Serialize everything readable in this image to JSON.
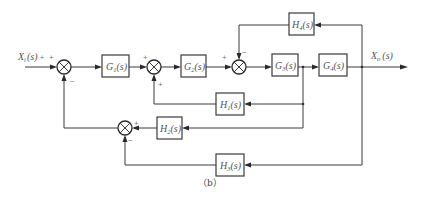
{
  "diagram": {
    "type": "control-system-block-diagram",
    "caption": "（b）",
    "input": {
      "label": "X",
      "subscript": "i",
      "suffix": "(s)",
      "sign": "+"
    },
    "output": {
      "label": "X",
      "subscript": "o",
      "suffix": "(s)"
    },
    "blocks": {
      "G1": {
        "name": "G",
        "sub": "1",
        "arg": "(s)"
      },
      "G2": {
        "name": "G",
        "sub": "2",
        "arg": "(s)"
      },
      "G3": {
        "name": "G",
        "sub": "3",
        "arg": "(s)"
      },
      "G4": {
        "name": "G",
        "sub": "4",
        "arg": "(s)"
      },
      "H1": {
        "name": "H",
        "sub": "1",
        "arg": "(s)"
      },
      "H2": {
        "name": "H",
        "sub": "2",
        "arg": "(s)"
      },
      "H3": {
        "name": "H",
        "sub": "3",
        "arg": "(s)"
      },
      "H4": {
        "name": "H",
        "sub": "4",
        "arg": "(s)"
      }
    },
    "summing_junctions": [
      {
        "id": "S1",
        "signs": {
          "left": "+",
          "bottom": "−"
        }
      },
      {
        "id": "S2",
        "signs": {
          "left": "+",
          "bottom": "+"
        }
      },
      {
        "id": "S3",
        "signs": {
          "left": "+",
          "top": "−"
        }
      },
      {
        "id": "S4",
        "signs": {
          "right": "+",
          "bottom": "−"
        }
      }
    ],
    "connections": [
      "Xi(s) -> S1",
      "S1 -> G1 -> S2 -> G2 -> S3 -> G3 -> G4 -> Xo(s)",
      "Xo(s) -> H4 -> S3 (−)",
      "G3 output -> H1 -> S2 (+)",
      "G3 output -> H2 -> S4 (+)",
      "Xo(s) -> H3 -> S4 (−)",
      "S4 -> S1 (−)"
    ]
  }
}
